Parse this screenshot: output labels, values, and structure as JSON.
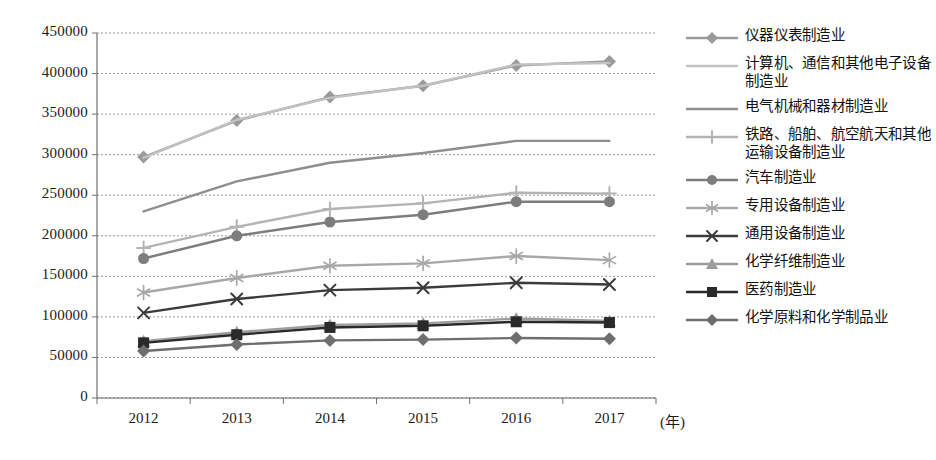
{
  "chart_data": {
    "type": "line",
    "title": "",
    "xlabel": "(年)",
    "ylabel": "",
    "x": [
      "2012",
      "2013",
      "2014",
      "2015",
      "2016",
      "2017"
    ],
    "categories": [
      "2012",
      "2013",
      "2014",
      "2015",
      "2016",
      "2017"
    ],
    "ylim": [
      0,
      450000
    ],
    "ytick_labels": [
      "0",
      "50000",
      "100000",
      "150000",
      "200000",
      "250000",
      "300000",
      "350000",
      "400000",
      "450000"
    ],
    "ytick_values": [
      0,
      50000,
      100000,
      150000,
      200000,
      250000,
      300000,
      350000,
      400000,
      450000
    ],
    "grid": true,
    "legend_position": "right",
    "series": [
      {
        "name": "仪器仪表制造业",
        "marker": "diamond",
        "color": "#9a9a9a",
        "values": [
          297000,
          342000,
          371000,
          385000,
          410000,
          415000
        ]
      },
      {
        "name": "计算机、通信和其他电子设备制造业",
        "marker": "none",
        "color": "#c2c2c2",
        "values": [
          296000,
          343000,
          370000,
          385000,
          411000,
          413000
        ]
      },
      {
        "name": "电气机械和器材制造业",
        "marker": "none",
        "color": "#8e8e8e",
        "values": [
          230000,
          267000,
          290000,
          302000,
          317000,
          317000
        ]
      },
      {
        "name": "铁路、船舶、航空航天和其他运输设备制造业",
        "marker": "plus",
        "color": "#b4b4b4",
        "values": [
          185000,
          211000,
          233000,
          240000,
          253000,
          252000
        ]
      },
      {
        "name": "汽车制造业",
        "marker": "circle",
        "color": "#7d7d7d",
        "values": [
          172000,
          200000,
          217000,
          226000,
          242000,
          242000
        ]
      },
      {
        "name": "专用设备制造业",
        "marker": "asterisk",
        "color": "#a8a8a8",
        "values": [
          130000,
          148000,
          163000,
          166000,
          175000,
          170000
        ]
      },
      {
        "name": "通用设备制造业",
        "marker": "x",
        "color": "#3b3b3b",
        "values": [
          105000,
          122000,
          133000,
          136000,
          142000,
          140000
        ]
      },
      {
        "name": "化学纤维制造业",
        "marker": "triangle",
        "color": "#9d9d9d",
        "values": [
          70000,
          81000,
          90000,
          92000,
          98000,
          95000
        ]
      },
      {
        "name": "医药制造业",
        "marker": "square",
        "color": "#2a2a2a",
        "values": [
          68000,
          78000,
          87000,
          89000,
          94000,
          93000
        ]
      },
      {
        "name": "化学原料和化学制品业",
        "marker": "diamond",
        "color": "#6e6e6e",
        "values": [
          58000,
          66000,
          71000,
          72000,
          74000,
          73000
        ]
      }
    ]
  },
  "legend": {
    "items": [
      {
        "label": "仪器仪表制造业"
      },
      {
        "label": "计算机、通信和其他电子设备制造业"
      },
      {
        "label": "电气机械和器材制造业"
      },
      {
        "label": "铁路、船舶、航空航天和其他运输设备制造业"
      },
      {
        "label": "汽车制造业"
      },
      {
        "label": "专用设备制造业"
      },
      {
        "label": "通用设备制造业"
      },
      {
        "label": "化学纤维制造业"
      },
      {
        "label": "医药制造业"
      },
      {
        "label": "化学原料和化学制品业"
      }
    ]
  }
}
